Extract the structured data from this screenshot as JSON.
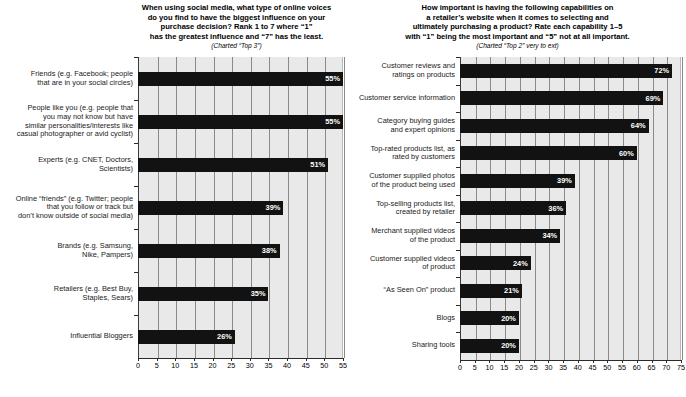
{
  "chart_data": [
    {
      "type": "bar",
      "orientation": "horizontal",
      "panel": "left",
      "title": "When using social media, what type of online voices do you find to have the biggest influence on your purchase decision? Rank 1 to 7 where \"1\" has the greatest influence and \"7\" has the least.",
      "subtitle": "(Charted “Top 3”)",
      "title_lines": [
        "When using social media, what type of online voices",
        "do you find to have the biggest influence on your",
        "purchase decision? Rank 1 to 7 where “1”",
        "has the greatest influence and “7” has the least."
      ],
      "xlabel": "",
      "ylabel": "",
      "xlim": [
        0,
        55
      ],
      "xticks": [
        0,
        5,
        10,
        15,
        20,
        25,
        30,
        35,
        40,
        45,
        50,
        55
      ],
      "grid": true,
      "legend": "none",
      "value_suffix": "%",
      "categories": [
        "Friends (e.g. Facebook; people\nthat are in your social circles)",
        "People like you (e.g. people that\nyou may not know but have\nsimilar personalities/interests like\ncasual photographer or avid cyclist)",
        "Experts (e.g. CNET, Doctors,\nScientists)",
        "Online “friends” (e.g. Twitter; people\nthat you follow or track but\ndon’t know outside of social media)",
        "Brands (e.g. Samsung,\nNike, Pampers)",
        "Retailers (e.g. Best Buy,\nStaples, Sears)",
        "Influential Bloggers"
      ],
      "values": [
        55,
        55,
        51,
        39,
        38,
        35,
        26
      ],
      "value_labels": [
        "55%",
        "55%",
        "51%",
        "39%",
        "38%",
        "35%",
        "26%"
      ]
    },
    {
      "type": "bar",
      "orientation": "horizontal",
      "panel": "right",
      "title": "How important is having the following capabilities on a retailer's website when it comes to selecting and ultimately purchasing a product? Rate each capability 1–5 with \"1\" being the most important and \"5\" not at all important.",
      "subtitle": "(Charted “Top 2” very to ext)",
      "title_lines": [
        "How important is having the following capabilities on",
        "a retailer’s website when it comes to selecting and",
        "ultimately purchasing a product? Rate each capability 1–5",
        "with “1” being the most important and “5” not at all important."
      ],
      "xlabel": "",
      "ylabel": "",
      "xlim": [
        0,
        75
      ],
      "xticks": [
        0,
        5,
        10,
        15,
        20,
        25,
        30,
        35,
        40,
        45,
        50,
        55,
        60,
        65,
        70,
        75
      ],
      "grid": true,
      "legend": "none",
      "value_suffix": "%",
      "categories": [
        "Customer reviews and\nratings on products",
        "Customer service information",
        "Category buying guides\nand expert opinions",
        "Top-rated products list, as\nrated by customers",
        "Customer supplied photos\nof the product being used",
        "Top-selling products list,\ncreated by retailer",
        "Merchant supplied videos\nof the product",
        "Customer supplied videos\nof product",
        "“As Seen On” product",
        "Blogs",
        "Sharing tools"
      ],
      "values": [
        72,
        69,
        64,
        60,
        39,
        36,
        34,
        24,
        21,
        20,
        20
      ],
      "value_labels": [
        "72%",
        "69%",
        "64%",
        "60%",
        "39%",
        "36%",
        "34%",
        "24%",
        "21%",
        "20%",
        "20%"
      ]
    }
  ],
  "colors": {
    "bar": "#121212",
    "plot_background": "#e9e9e9",
    "gridline": "#8a8a8a",
    "axis": "#2b2b2b",
    "value_text": "#ffffff",
    "label_text": "#1a1a1a"
  }
}
